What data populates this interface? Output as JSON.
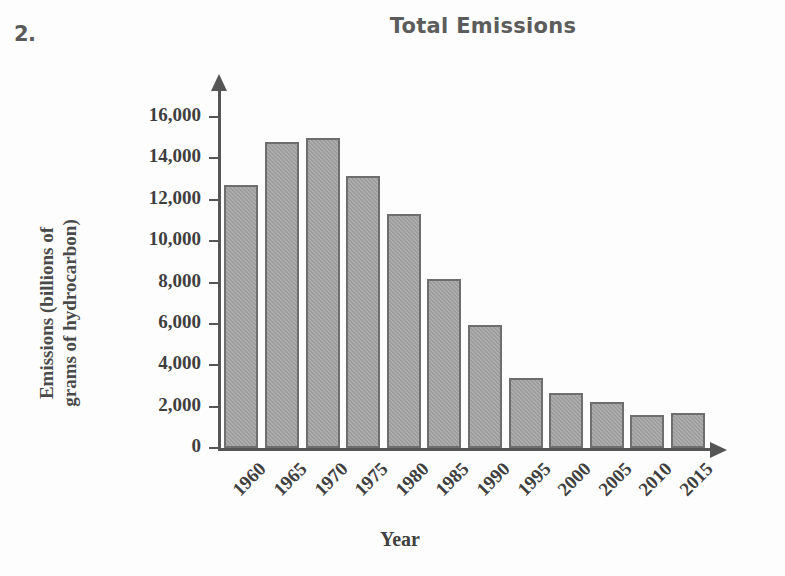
{
  "problem": {
    "number": "2."
  },
  "chart_data": {
    "type": "bar",
    "title": "Total Emissions",
    "xlabel": "Year",
    "ylabel": "Emissions (billions of grams of hydrocarbon)",
    "ylabel_line1": "Emissions (billions of",
    "ylabel_line2": "grams of hydrocarbon)",
    "categories": [
      "1960",
      "1965",
      "1970",
      "1975",
      "1980",
      "1985",
      "1990",
      "1995",
      "2000",
      "2005",
      "2010",
      "2015"
    ],
    "values": [
      12700,
      14800,
      15000,
      13150,
      11300,
      8150,
      5950,
      3400,
      2650,
      2200,
      1600,
      1700
    ],
    "ylim": [
      0,
      16000
    ],
    "ytick_values": [
      0,
      2000,
      4000,
      6000,
      8000,
      10000,
      12000,
      14000,
      16000
    ],
    "ytick_labels": [
      "0",
      "2,000",
      "4,000",
      "6,000",
      "8,000",
      "10,000",
      "12,000",
      "14,000",
      "16,000"
    ],
    "grid": false,
    "legend": false,
    "bar_color": "#9d9d9d",
    "bar_border_color": "#6e6e6e",
    "axis_color": "#555555",
    "title_color": "#5c5c5c",
    "text_color": "#3f3f3f"
  }
}
